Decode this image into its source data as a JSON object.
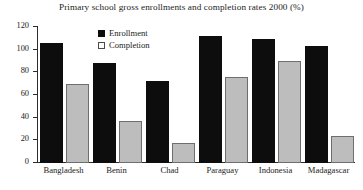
{
  "chart_data": {
    "type": "bar",
    "title": "Primary school gross enrollments and completion rates 2000 (%)",
    "xlabel": "",
    "ylabel": "",
    "ylim": [
      0,
      120
    ],
    "yticks": [
      0,
      20,
      40,
      60,
      80,
      100,
      120
    ],
    "grid": false,
    "legend_position": "top-left-inside",
    "categories": [
      "Bangladesh",
      "Benin",
      "Chad",
      "Paraguay",
      "Indonesia",
      "Madagascar"
    ],
    "series": [
      {
        "name": "Enrollment",
        "color": "#0d0d0d",
        "values": [
          106,
          88,
          72,
          112,
          109,
          103
        ]
      },
      {
        "name": "Completion",
        "color": "#bdbdbd",
        "values": [
          70,
          37,
          18,
          76,
          90,
          24
        ]
      }
    ]
  },
  "legend": {
    "items": [
      {
        "label": "Enrollment"
      },
      {
        "label": "Completion"
      }
    ]
  },
  "axis": {
    "y_tick_labels": [
      "120",
      "100",
      "80",
      "60",
      "40",
      "20",
      "0"
    ]
  }
}
